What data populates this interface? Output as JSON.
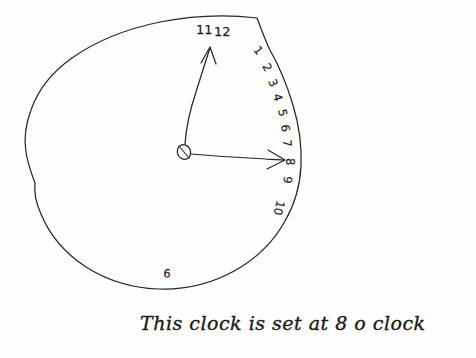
{
  "image": {
    "title": "Hand-drawn clock face sketch",
    "medium": "pen on paper",
    "background_color": "#fefefe",
    "ink_color": "#262626",
    "width": 476,
    "height": 358
  },
  "clock": {
    "label": "clock-face",
    "center_x": 184,
    "center_y": 152,
    "hub_label": "center-hub",
    "numerals": [
      {
        "value": "11",
        "x": 196,
        "y": 34,
        "rotation": -8
      },
      {
        "value": "12",
        "x": 214,
        "y": 36,
        "rotation": -4
      },
      {
        "value": "1",
        "x": 253,
        "y": 50,
        "rotation": 52
      },
      {
        "value": "2",
        "x": 262,
        "y": 66,
        "rotation": 62
      },
      {
        "value": "3",
        "x": 268,
        "y": 81,
        "rotation": 68
      },
      {
        "value": "4",
        "x": 273,
        "y": 95,
        "rotation": 74
      },
      {
        "value": "5",
        "x": 278,
        "y": 110,
        "rotation": 78
      },
      {
        "value": "6",
        "x": 281,
        "y": 125,
        "rotation": 82
      },
      {
        "value": "7",
        "x": 283,
        "y": 140,
        "rotation": 86
      },
      {
        "value": "8",
        "x": 286,
        "y": 158,
        "rotation": 90
      },
      {
        "value": "9",
        "x": 284,
        "y": 176,
        "rotation": 94
      },
      {
        "value": "10",
        "x": 277,
        "y": 200,
        "rotation": 104
      }
    ],
    "stray_numeral": {
      "value": "6",
      "x": 163,
      "y": 277,
      "rotation": 6
    },
    "hands": [
      {
        "name": "minute-hand",
        "points_to": "12",
        "tip_x": 210,
        "tip_y": 47,
        "has_arrowhead": true
      },
      {
        "name": "hour-hand",
        "points_to": "8",
        "tip_x": 284,
        "tip_y": 160,
        "has_arrowhead": true
      }
    ]
  },
  "caption": {
    "name": "handwritten-caption",
    "text": "This clock is set at 8 o clock",
    "x": 140,
    "y": 330
  }
}
